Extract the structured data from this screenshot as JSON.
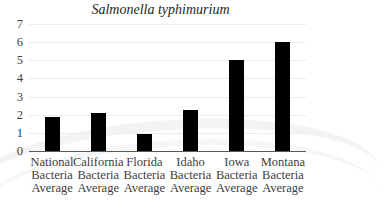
{
  "chart_data": {
    "type": "bar",
    "title": "Salmonella typhimurium",
    "xlabel": "",
    "ylabel": "",
    "ylim": [
      0,
      7
    ],
    "yticks": [
      "0",
      "1",
      "2",
      "3",
      "4",
      "5",
      "6",
      "7"
    ],
    "grid": true,
    "legend": null,
    "categories": [
      "National Bacteria Average",
      "California Bacteria Average",
      "Florida Bacteria Average",
      "Idaho Bacteria Average",
      "Iowa Bacteria Average",
      "Montana Bacteria Average"
    ],
    "category_lines": [
      [
        "National",
        "Bacteria",
        "Average"
      ],
      [
        "California",
        "Bacteria",
        "Average"
      ],
      [
        "Florida",
        "Bacteria",
        "Average"
      ],
      [
        "Idaho",
        "Bacteria",
        "Average"
      ],
      [
        "Iowa",
        "Bacteria",
        "Average"
      ],
      [
        "Montana",
        "Bacteria",
        "Average"
      ]
    ],
    "values": [
      1.9,
      2.1,
      0.95,
      2.25,
      5.0,
      6.0
    ],
    "bar_color": "#000000"
  }
}
